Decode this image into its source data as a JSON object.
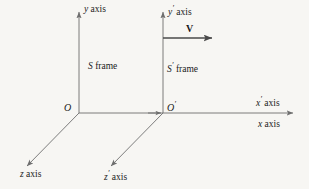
{
  "figure": {
    "background_color": "#f7f6f3",
    "line_color": "#6e6e6e",
    "text_color": "#1a1a1a",
    "vector_color": "#4a4a4a"
  },
  "labels": {
    "y_axis": "y axis",
    "y_prime_axis": "y′ axis",
    "x_axis": "x axis",
    "x_prime_axis": "x′ axis",
    "z_axis": "z axis",
    "z_prime_axis": "z′ axis",
    "origin_o": "O",
    "origin_o_prime": "O′",
    "s_frame": "S frame",
    "s_prime_frame": "S′ frame",
    "velocity_vector": "V"
  },
  "label_parts": {
    "y_symbol": "y",
    "x_symbol": "x",
    "z_symbol": "z",
    "prime": "′",
    "axis_word": "axis",
    "frame_word": "frame",
    "s_symbol": "S",
    "o_symbol": "O"
  },
  "geometry": {
    "origin_o": {
      "x": 79,
      "y": 113
    },
    "origin_o_prime": {
      "x": 163,
      "y": 113
    },
    "y_axis": {
      "x1": 79,
      "y1": 113,
      "x2": 79,
      "y2": 10
    },
    "y_prime_axis": {
      "x1": 163,
      "y1": 113,
      "x2": 163,
      "y2": 10
    },
    "x_axis": {
      "x1": 79,
      "y1": 113,
      "x2": 295,
      "y2": 113
    },
    "z_axis": {
      "x1": 79,
      "y1": 113,
      "x2": 25,
      "y2": 168
    },
    "z_prime_axis": {
      "x1": 163,
      "y1": 113,
      "x2": 109,
      "y2": 168
    },
    "velocity_arrow": {
      "x1": 163,
      "y1": 38,
      "x2": 216,
      "y2": 38
    }
  }
}
